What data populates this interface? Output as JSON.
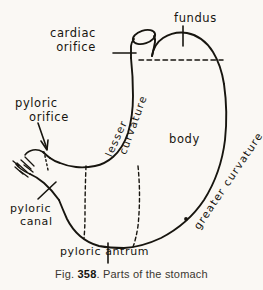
{
  "figure": {
    "caption_prefix": "Fig.",
    "caption_number": "358",
    "caption_number_suffix": ".",
    "caption_text": "Parts of the stomach",
    "subject": "stomach",
    "ink_color": "#17150f",
    "paper_color": "#faf8f4"
  },
  "labels": {
    "cardiac_orifice": {
      "line1": "cardiac",
      "line2": "orifice"
    },
    "fundus": {
      "line1": "fundus"
    },
    "pyloric_orifice": {
      "line1": "pyloric",
      "line2": "orifice"
    },
    "body": {
      "line1": "body"
    },
    "lesser_curvature": {
      "line1": "lesser",
      "line2": "curvature"
    },
    "greater_curvature": {
      "line1": "greater curvature"
    },
    "pyloric_canal": {
      "line1": "pyloric",
      "line2": "canal"
    },
    "pyloric_antrum": {
      "line1": "pyloric antrum"
    }
  },
  "diagram_parts": [
    "oesophagus",
    "cardiac orifice",
    "fundus",
    "body",
    "lesser curvature",
    "greater curvature",
    "pyloric antrum",
    "pyloric canal",
    "pyloric orifice",
    "cut duodenum"
  ]
}
